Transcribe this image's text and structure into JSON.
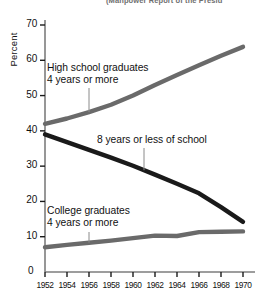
{
  "source_note": "(Manpower Report of the Presid",
  "chart_data": {
    "type": "line",
    "title": "",
    "xlabel": "",
    "ylabel": "Percent",
    "xlim": [
      1951,
      1970.6
    ],
    "ylim": [
      0,
      73
    ],
    "grid": false,
    "legend_position": "inline-labels",
    "x_ticks": [
      "1952",
      "1954",
      "1956",
      "1958",
      "1960",
      "1962",
      "1964",
      "1966",
      "1968",
      "1970"
    ],
    "y_ticks": [
      "0",
      "10",
      "20",
      "30",
      "40",
      "50",
      "60",
      "70"
    ],
    "origin_label": "0",
    "x": [
      1952,
      1954,
      1956,
      1958,
      1960,
      1962,
      1964,
      1966,
      1968,
      1970
    ],
    "series": [
      {
        "name": "high-school-graduates",
        "label_line1": "High school graduates",
        "label_line2": "4 years or more",
        "color": "#6a6a6a",
        "values": [
          42.0,
          43.5,
          45.3,
          47.4,
          50.0,
          53.0,
          55.8,
          58.6,
          61.3,
          63.8
        ]
      },
      {
        "name": "eight-years-or-less",
        "label_line1": "8 years or less of school",
        "label_line2": "",
        "color": "#1a1a1a",
        "values": [
          39.0,
          36.8,
          34.6,
          32.4,
          30.1,
          27.6,
          25.0,
          22.3,
          18.4,
          14.2
        ]
      },
      {
        "name": "college-graduates",
        "label_line1": "College graduates",
        "label_line2": "4 years or more",
        "color": "#6a6a6a",
        "values": [
          7.0,
          7.7,
          8.3,
          8.9,
          9.6,
          10.3,
          10.2,
          11.3,
          11.4,
          11.5
        ]
      }
    ],
    "annotations": [
      {
        "name": "leader-high-school",
        "series": "high-school-graduates",
        "at_x": 1956
      },
      {
        "name": "leader-eight-years",
        "series": "eight-years-or-less",
        "at_x": 1961
      },
      {
        "name": "leader-college",
        "series": "college-graduates",
        "at_x": 1956
      }
    ]
  }
}
